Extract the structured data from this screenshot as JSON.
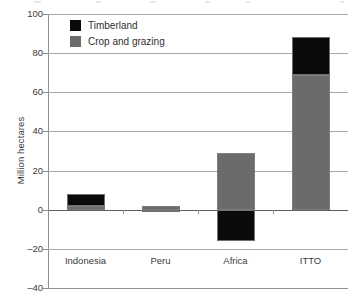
{
  "chart_data": {
    "type": "bar",
    "title": "",
    "subtitle": "",
    "xlabel": "",
    "ylabel": "Million hectares",
    "categories": [
      "Indonesia",
      "Peru",
      "Africa",
      "ITTO"
    ],
    "series": [
      {
        "name": "Timberland",
        "color": "#0a0a0a",
        "values": [
          6,
          -1,
          -16,
          19
        ]
      },
      {
        "name": "Crop and grazing",
        "color": "#6b6b6b",
        "values": [
          2,
          2,
          29,
          69
        ]
      }
    ],
    "stacked": true,
    "ylim": [
      -40,
      100
    ],
    "yticks": [
      100,
      80,
      60,
      40,
      20,
      0,
      -20,
      -40
    ],
    "ytick_labels": [
      "100",
      "80",
      "60",
      "40",
      "20",
      "0",
      "–20",
      "–40"
    ],
    "grid": true,
    "legend_position": "top-left",
    "totals": [
      8,
      1,
      13,
      88
    ]
  },
  "legend": {
    "items": [
      {
        "label": "Timberland",
        "color": "#0a0a0a"
      },
      {
        "label": "Crop and grazing",
        "color": "#6b6b6b"
      }
    ]
  },
  "axis": {
    "y_title": "Million hectares"
  },
  "colors": {
    "timberland": "#0a0a0a",
    "crop_and_grazing": "#6b6b6b",
    "gridline": "#a9a9a9",
    "axis": "#8f8f8f",
    "text": "#3a3a3a",
    "background": "#ffffff"
  }
}
